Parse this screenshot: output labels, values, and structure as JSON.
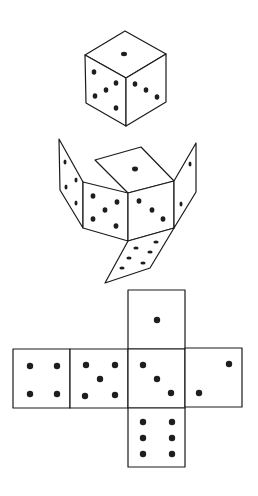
{
  "colors": {
    "line": "#1a1a1a",
    "pip": "#1e1e1e",
    "background": "#ffffff"
  },
  "figures": [
    {
      "name": "assembled-die",
      "visible_faces": {
        "top": 1,
        "left": 5,
        "right": 3
      }
    },
    {
      "name": "unfolding-die",
      "faces": {
        "lid": 1,
        "left-flap": 4,
        "front-left": 5,
        "front-right": 3,
        "right-flap": 2,
        "bottom-flap": 6
      }
    },
    {
      "name": "flat-net",
      "faces": {
        "top": 1,
        "row": [
          4,
          5,
          3,
          2
        ],
        "bottom": 6
      }
    }
  ]
}
